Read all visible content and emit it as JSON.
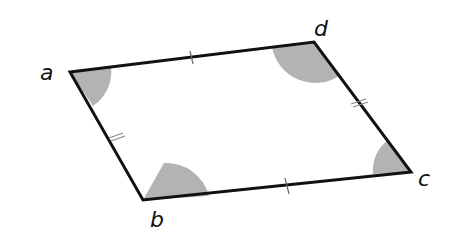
{
  "figure": {
    "colors": {
      "stroke": "#111111",
      "angle_fill": "#b3b3b3",
      "tick": "#888888",
      "background": "#ffffff"
    },
    "vertices": {
      "a": {
        "label": "a",
        "x": 70,
        "y": 72
      },
      "d": {
        "label": "d",
        "x": 314,
        "y": 42
      },
      "c": {
        "label": "c",
        "x": 411,
        "y": 172
      },
      "b": {
        "label": "b",
        "x": 143,
        "y": 200
      }
    },
    "side_marks": {
      "ad": "single tick",
      "bc": "single tick",
      "ab": "double tick",
      "dc": "double tick"
    },
    "angle_marks": {
      "a": "small shaded sector",
      "c": "small shaded sector",
      "b": "large shaded sector",
      "d": "large shaded sector"
    }
  }
}
